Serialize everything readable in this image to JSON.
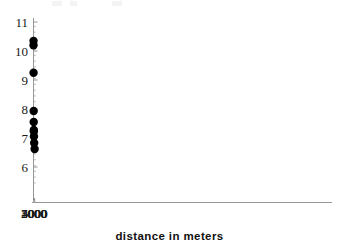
{
  "chart_data": {
    "type": "scatter",
    "title": "",
    "subtitle": "",
    "xlabel": "distance in meters",
    "ylabel": "",
    "xlim": [
      0,
      5300
    ],
    "ylim": [
      5.45,
      11.0
    ],
    "grid": false,
    "legend": null,
    "x_ticks": [
      1000,
      2000,
      3000,
      4000,
      5000
    ],
    "x_tick_labels": [
      "1000",
      "2000",
      "3000",
      "4000",
      "5000"
    ],
    "y_ticks": [
      6,
      7,
      8,
      9,
      10,
      11
    ],
    "y_tick_labels": [
      "6",
      "7",
      "8",
      "9",
      "10",
      "11"
    ],
    "x_minor_tick_step": 200,
    "y_minor_tick_step": 0.2,
    "marker": "filled-circle",
    "marker_color": "#000000",
    "marker_size_px": 4.2,
    "x": [
      70,
      160,
      355,
      745,
      960,
      1440,
      1530,
      1975,
      2970,
      4980
    ],
    "y": [
      10.2,
      10.35,
      9.25,
      7.93,
      7.55,
      7.28,
      7.22,
      7.05,
      6.83,
      6.62
    ],
    "points": [
      {
        "x": 70,
        "y": 10.2
      },
      {
        "x": 160,
        "y": 10.35
      },
      {
        "x": 355,
        "y": 9.25
      },
      {
        "x": 745,
        "y": 7.93
      },
      {
        "x": 960,
        "y": 7.55
      },
      {
        "x": 1440,
        "y": 7.28
      },
      {
        "x": 1530,
        "y": 7.22
      },
      {
        "x": 1975,
        "y": 7.05
      },
      {
        "x": 2970,
        "y": 6.83
      },
      {
        "x": 4980,
        "y": 6.62
      }
    ],
    "annotations": []
  },
  "axes": {
    "x_title": "distance in meters",
    "y_title": ""
  }
}
